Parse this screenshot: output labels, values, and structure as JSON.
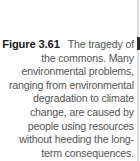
{
  "caption": {
    "label": "Figure 3.61",
    "text": "The tragedy of the commons. Many environmental problems, ranging from environmental degradation to climate change, are caused by people using resources without heeding the long-term consequences."
  }
}
